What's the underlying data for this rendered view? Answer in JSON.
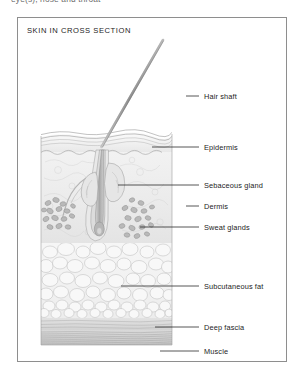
{
  "page": {
    "running_header": "eye(s), nose and throat",
    "background": "#ffffff"
  },
  "figure": {
    "title": "SKIN IN CROSS SECTION",
    "frame_color": "#8e8e8e",
    "ink_color": "#6b6b6b",
    "tint_color": "#d8d8d8"
  },
  "labels": [
    {
      "id": "hair-shaft",
      "text": "Hair shaft",
      "x": 204,
      "y": 93,
      "leader_y": 96,
      "leader_x1": 186,
      "leader_x2": 199
    },
    {
      "id": "epidermis",
      "text": "Epidermis",
      "x": 204,
      "y": 144,
      "leader_y": 147,
      "leader_x1": 152,
      "leader_x2": 199
    },
    {
      "id": "sebaceous-gland",
      "text": "Sebaceous gland",
      "x": 204,
      "y": 182,
      "leader_y": 185,
      "leader_x1": 118,
      "leader_x2": 199
    },
    {
      "id": "dermis",
      "text": "Dermis",
      "x": 204,
      "y": 203,
      "leader_y": 206,
      "leader_x1": 186,
      "leader_x2": 199
    },
    {
      "id": "sweat-glands",
      "text": "Sweat glands",
      "x": 204,
      "y": 224,
      "leader_y": 227,
      "leader_x1": 140,
      "leader_x2": 199
    },
    {
      "id": "subcutaneous-fat",
      "text": "Subcutaneous fat",
      "x": 204,
      "y": 283,
      "leader_y": 286,
      "leader_x1": 121,
      "leader_x2": 199
    },
    {
      "id": "deep-fascia",
      "text": "Deep fascia",
      "x": 204,
      "y": 324,
      "leader_y": 327,
      "leader_x1": 155,
      "leader_x2": 199
    },
    {
      "id": "muscle",
      "text": "Muscle",
      "x": 204,
      "y": 348,
      "leader_y": 351,
      "leader_x1": 160,
      "leader_x2": 199
    }
  ],
  "anatomy": {
    "block_left": 41,
    "block_right": 172,
    "surface_y": 134,
    "epidermis_bottom": 152,
    "dermis_bottom": 243,
    "fat_bottom": 318,
    "fascia_bottom": 330,
    "muscle_bottom": 345,
    "layers": [
      {
        "name": "epidermis",
        "label": "Epidermis"
      },
      {
        "name": "dermis",
        "label": "Dermis"
      },
      {
        "name": "subcutaneous-fat",
        "label": "Subcutaneous fat"
      },
      {
        "name": "deep-fascia",
        "label": "Deep fascia"
      },
      {
        "name": "muscle",
        "label": "Muscle"
      }
    ],
    "structures": [
      {
        "name": "hair-shaft",
        "label": "Hair shaft"
      },
      {
        "name": "hair-follicle",
        "label": "Hair follicle"
      },
      {
        "name": "sebaceous-gland",
        "label": "Sebaceous gland"
      },
      {
        "name": "sweat-gland",
        "label": "Sweat glands"
      }
    ]
  }
}
